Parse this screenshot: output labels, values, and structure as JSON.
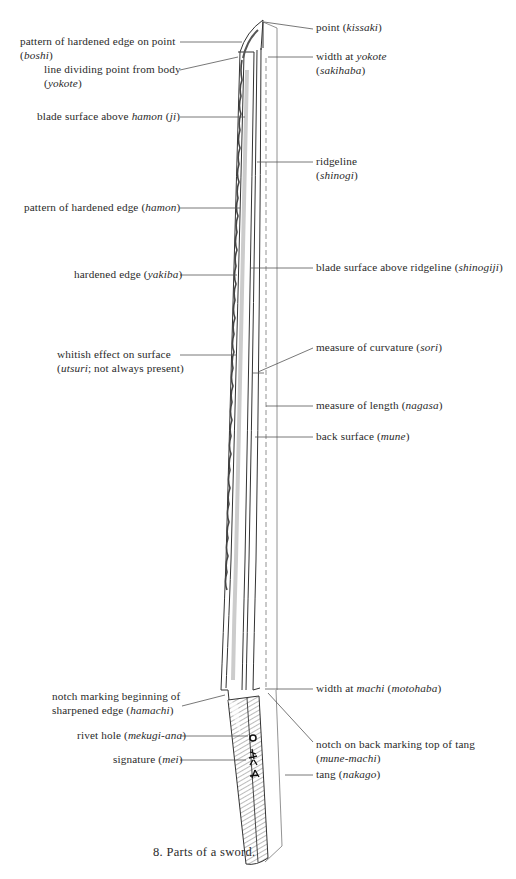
{
  "figure": {
    "caption": "8. Parts of a sword."
  },
  "labels_left": [
    {
      "id": "boshi",
      "text": "pattern of hardened edge on point",
      "term": "boshi"
    },
    {
      "id": "yokote",
      "text": "line dividing point from body",
      "term": "yokote"
    },
    {
      "id": "ji",
      "text_pre": "blade surface above ",
      "text_em": "hamon",
      "text_post": " (",
      "term": "ji"
    },
    {
      "id": "hamon",
      "text": "pattern of hardened edge",
      "term": "hamon"
    },
    {
      "id": "yakiba",
      "text": "hardened edge",
      "term": "yakiba"
    },
    {
      "id": "utsuri",
      "line1": "whitish effect on surface",
      "term": "utsuri",
      "line2_post": "; not always present)"
    },
    {
      "id": "hamachi",
      "line1": "notch marking beginning of",
      "line2_pre": "sharpened edge",
      "term": "hamachi"
    },
    {
      "id": "mekugi-ana",
      "text": "rivet hole",
      "term": "mekugi-ana"
    },
    {
      "id": "mei",
      "text": "signature",
      "term": "mei"
    }
  ],
  "labels_right": [
    {
      "id": "kissaki",
      "text": "point",
      "term": "kissaki"
    },
    {
      "id": "sakihaba",
      "line1_pre": "width at ",
      "line1_em": "yokote",
      "term": "sakihaba"
    },
    {
      "id": "shinogi",
      "line1": "ridgeline",
      "term": "shinogi"
    },
    {
      "id": "shinogiji",
      "text": "blade surface above ridgeline",
      "term": "shinogiji"
    },
    {
      "id": "sori",
      "text": "measure of curvature",
      "term": "sori"
    },
    {
      "id": "nagasa",
      "text": "measure of length",
      "term": "nagasa"
    },
    {
      "id": "mune",
      "text": "back surface",
      "term": "mune"
    },
    {
      "id": "motohaba",
      "text_pre": "width at ",
      "text_em": "machi",
      "term": "motohaba"
    },
    {
      "id": "mune-machi",
      "line1": "notch on back marking top of tang",
      "term": "mune-machi"
    },
    {
      "id": "nakago",
      "text": "tang",
      "term": "nakago"
    }
  ]
}
